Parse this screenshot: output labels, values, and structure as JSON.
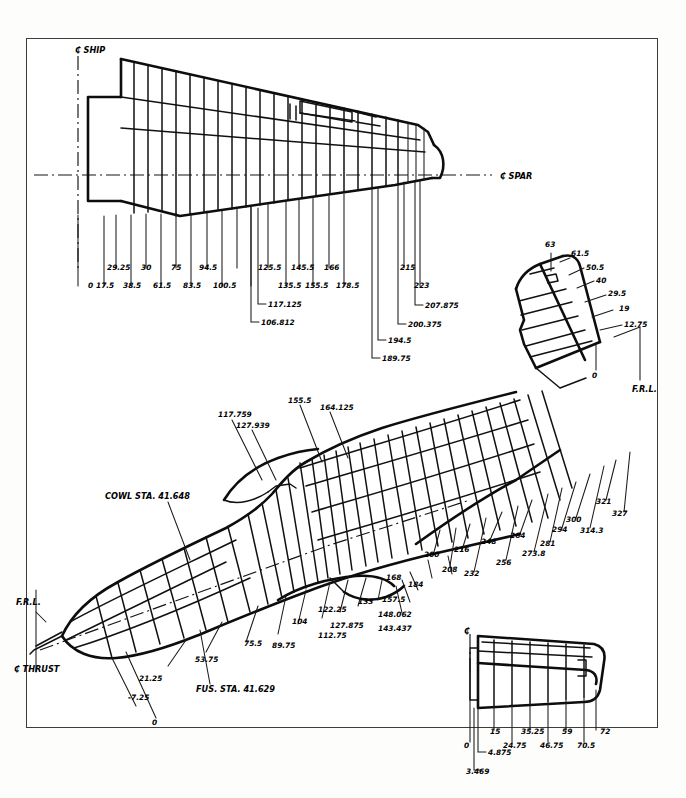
{
  "document": {
    "type": "engineering-drawing",
    "subject": "Aircraft structural station diagram",
    "background_color": "#fdfdfb",
    "ink_color": "#111111",
    "frame_color": "#3c3c3c"
  },
  "annotations": {
    "centerline_ship": "₵ SHIP",
    "centerline_spar": "₵ SPAR",
    "centerline_thrust": "₵ THRUST",
    "frl_left": "F.R.L.",
    "frl_right": "F.R.L.",
    "cowl_station": "COWL STA. 41.648",
    "fus_station": "FUS. STA. 41.629",
    "stab_centerline": "₵"
  },
  "views": {
    "wing_plan": {
      "name": "Wing plan view",
      "upper_stations": [
        "29.25",
        "30",
        "75",
        "94.5",
        "125.5",
        "145.5",
        "166",
        "215"
      ],
      "lower_stations": [
        "0",
        "17.5",
        "38.5",
        "61.5",
        "83.5",
        "100.5",
        "135.5",
        "155.5",
        "178.5",
        "223"
      ],
      "stepped_stations": [
        "117.125",
        "106.812",
        "207.875",
        "200.375",
        "194.5",
        "189.75"
      ]
    },
    "vertical_tail": {
      "name": "Vertical stabilizer / fin",
      "stations": [
        "63",
        "61.5",
        "50.5",
        "40",
        "29.5",
        "19",
        "12.75",
        "0"
      ]
    },
    "fuselage_side": {
      "name": "Fuselage side view",
      "upper_stations": [
        "117.759",
        "127.939",
        "155.5",
        "164.125"
      ],
      "lower_stations": [
        "21.25",
        "53.75",
        "75.5",
        "89.75",
        "104",
        "112.75",
        "122.25",
        "127.875",
        "133",
        "143.437",
        "148.062",
        "157.5",
        "168",
        "184"
      ],
      "aft_stations": [
        "200",
        "208",
        "216",
        "232",
        "248",
        "256",
        "264",
        "273.8",
        "281",
        "294",
        "300",
        "314.3",
        "321",
        "327"
      ],
      "nose_stations": [
        "-7.25",
        "0"
      ],
      "tail_datum": "0"
    },
    "horizontal_stabilizer": {
      "name": "Horizontal stabilizer plan view",
      "stations_upper": [
        "15",
        "35.25",
        "59",
        "72"
      ],
      "stations_lower": [
        "0",
        "24.75",
        "46.75",
        "70.5"
      ],
      "root_stations": [
        "4.875",
        "3.469"
      ]
    }
  }
}
